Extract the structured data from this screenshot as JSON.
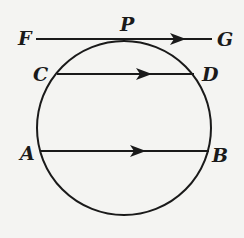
{
  "diagram": {
    "labels": {
      "F": "F",
      "P": "P",
      "G": "G",
      "C": "C",
      "D": "D",
      "A": "A",
      "B": "B"
    },
    "colors": {
      "stroke": "#1a1a1a",
      "background": "#f4f4f2"
    }
  }
}
